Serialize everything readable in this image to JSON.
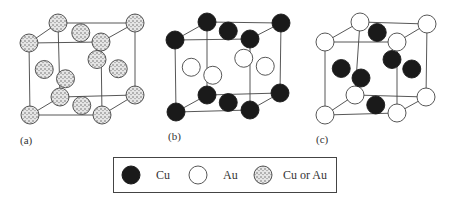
{
  "figure": {
    "panels": [
      {
        "id": "a",
        "label": "(a)",
        "structure": "fcc disordered",
        "corner_atom": "mixed",
        "face_center_atom": "mixed"
      },
      {
        "id": "b",
        "label": "(b)",
        "structure": "L1_0 ordered (CuAu)",
        "corner_atom": "Cu",
        "top_bottom_face_atom": "Cu",
        "side_face_atom": "Au"
      },
      {
        "id": "c",
        "label": "(c)",
        "structure": "L1_2 ordered (Cu3Au)",
        "corner_atom": "Au",
        "face_center_atom": "Cu"
      }
    ]
  },
  "legend": {
    "items": [
      {
        "symbol": "filled-circle",
        "label": "Cu",
        "color": "#1a1a1a"
      },
      {
        "symbol": "open-circle",
        "label": "Au",
        "color": "#ffffff"
      },
      {
        "symbol": "stippled-circle",
        "label": "Cu or Au",
        "color": "#d8d8d8"
      }
    ]
  },
  "colors": {
    "cu": "#1a1a1a",
    "au": "#ffffff",
    "mixed": "#d9d9d9",
    "line": "#444444"
  }
}
